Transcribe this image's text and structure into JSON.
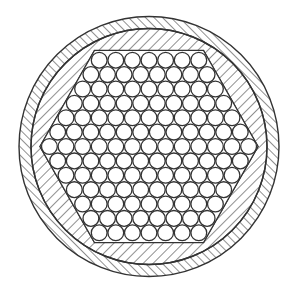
{
  "diagram": {
    "type": "cable-cross-section",
    "canvas": {
      "width": 299,
      "height": 293,
      "background": "#ffffff"
    },
    "stroke_color": "#333333",
    "center": {
      "x": 149,
      "y": 146.5
    },
    "outer_sheath": {
      "outer_radius": 130,
      "inner_radius": 118,
      "hatch": "backslash",
      "hatch_spacing": 6
    },
    "filler": {
      "hatch": "slash",
      "hatch_spacing": 7
    },
    "hexagon": {
      "half_width": 109,
      "half_height": 96,
      "orientation": "flat-top"
    },
    "strands": {
      "diameter": 16.6,
      "row_counts": [
        7,
        8,
        9,
        10,
        11,
        12,
        13,
        12,
        11,
        10,
        9,
        8,
        7
      ],
      "total": 127
    }
  }
}
